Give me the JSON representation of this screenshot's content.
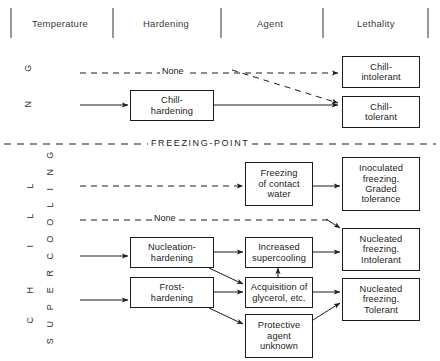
{
  "header": {
    "columns": [
      {
        "label": "Temperature"
      },
      {
        "label": "Hardening"
      },
      {
        "label": "Agent"
      },
      {
        "label": "Lethality"
      }
    ]
  },
  "axis": {
    "chilling_letters": [
      "G",
      "N"
    ],
    "chill_letters": [
      "L",
      "L",
      "I",
      "H",
      "C"
    ],
    "supercooling_letters": [
      "G",
      "N",
      "I",
      "L",
      "O",
      "O",
      "C",
      "R",
      "E",
      "P",
      "U",
      "S"
    ]
  },
  "divider": {
    "freezing_point_label": "FREEZING-POINT"
  },
  "edge_labels": {
    "none_upper": "None",
    "none_lower": "None"
  },
  "boxes": {
    "chill_hardening": "Chill-\nhardening",
    "chill_intolerant": "Chill-\nintolerant",
    "chill_tolerant": "Chill-\ntolerant",
    "freezing_contact_water": "Freezing\nof contact\nwater",
    "inoculated_freezing": "Inoculated\nfreezing.\nGraded\ntolerance",
    "nucleation_hardening": "Nucleation-\nhardening",
    "increased_supercooling": "Increased\nsupercooling",
    "nucleated_intolerant": "Nucleated\nfreezing.\nIntolerant",
    "frost_hardening": "Frost-\nhardening",
    "acquisition_glycerol": "Acquisition of\nglycerol, etc.",
    "nucleated_tolerant": "Nucleated\nfreezing.\nTolerant",
    "protective_agent": "Protective\nagent\nunknown"
  },
  "colors": {
    "stroke": "#1c1c1c",
    "header_text": "#3a3a3a",
    "background": "#ffffff"
  }
}
